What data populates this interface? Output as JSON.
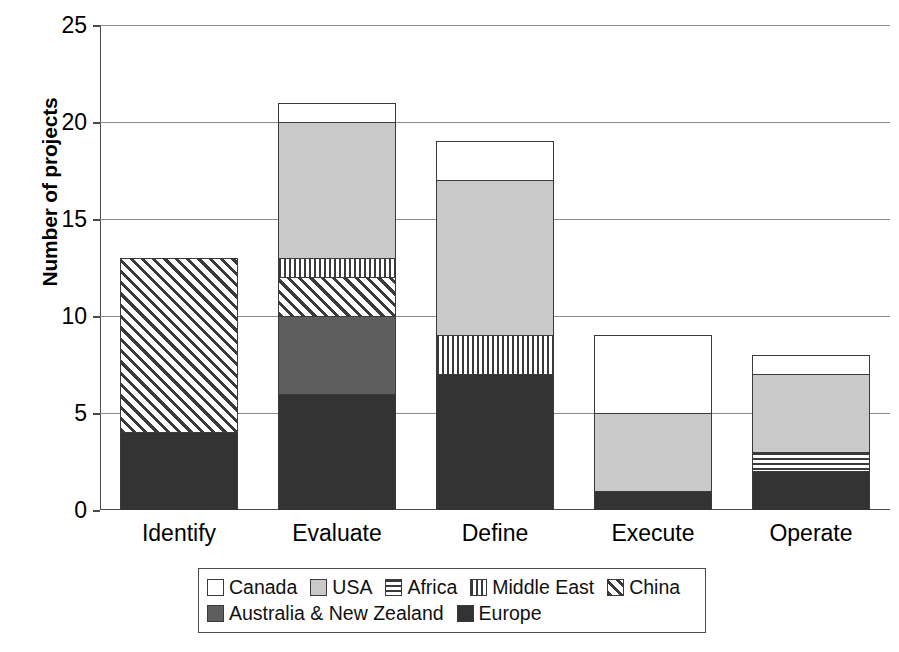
{
  "chart_data": {
    "type": "bar",
    "subtype": "stacked-bar",
    "title": "",
    "xlabel": "",
    "ylabel": "Number of projects",
    "ylim": [
      0,
      25
    ],
    "yticks": [
      0,
      5,
      10,
      15,
      20,
      25
    ],
    "grid": true,
    "legend_position": "bottom",
    "categories": [
      "Identify",
      "Evaluate",
      "Define",
      "Execute",
      "Operate"
    ],
    "series": [
      {
        "name": "Europe",
        "values": [
          4,
          6,
          7,
          1,
          2
        ],
        "color": "#333333",
        "pattern": "solid-dark"
      },
      {
        "name": "Australia & New Zealand",
        "values": [
          0,
          4,
          0,
          0,
          0
        ],
        "color": "#5e5e5e",
        "pattern": "solid-medium"
      },
      {
        "name": "China",
        "values": [
          9,
          2,
          0,
          0,
          0
        ],
        "color": "#ffffff",
        "pattern": "diagonal-hatch"
      },
      {
        "name": "Middle East",
        "values": [
          0,
          1,
          2,
          0,
          0
        ],
        "color": "#ffffff",
        "pattern": "vertical-stripes"
      },
      {
        "name": "Africa",
        "values": [
          0,
          0,
          0,
          0,
          1
        ],
        "color": "#ffffff",
        "pattern": "horizontal-stripes"
      },
      {
        "name": "USA",
        "values": [
          0,
          7,
          8,
          4,
          4
        ],
        "color": "#c9c9c9",
        "pattern": "solid-light"
      },
      {
        "name": "Canada",
        "values": [
          0,
          1,
          2,
          4,
          1
        ],
        "color": "#ffffff",
        "pattern": "empty"
      }
    ],
    "totals": [
      13,
      21,
      19,
      9,
      8
    ]
  },
  "axes": {
    "y_title": "Number of projects",
    "y_tick_labels": [
      "0",
      "5",
      "10",
      "15",
      "20",
      "25"
    ],
    "x_tick_labels": [
      "Identify",
      "Evaluate",
      "Define",
      "Execute",
      "Operate"
    ]
  },
  "legend": {
    "rows": [
      [
        {
          "label": "Canada",
          "pattern": "empty"
        },
        {
          "label": "USA",
          "pattern": "solid-light"
        },
        {
          "label": "Africa",
          "pattern": "horizontal-stripes"
        },
        {
          "label": "Middle East",
          "pattern": "vertical-stripes"
        },
        {
          "label": "China",
          "pattern": "diagonal-hatch"
        }
      ],
      [
        {
          "label": "Australia & New Zealand",
          "pattern": "solid-medium"
        },
        {
          "label": "Europe",
          "pattern": "solid-dark"
        }
      ]
    ]
  },
  "colors": {
    "europe": "#333333",
    "australia_new_zealand": "#5e5e5e",
    "usa": "#c9c9c9",
    "canada": "#ffffff",
    "axis": "#4a4a4a",
    "grid": "#8a8a8a",
    "background": "#ffffff"
  }
}
